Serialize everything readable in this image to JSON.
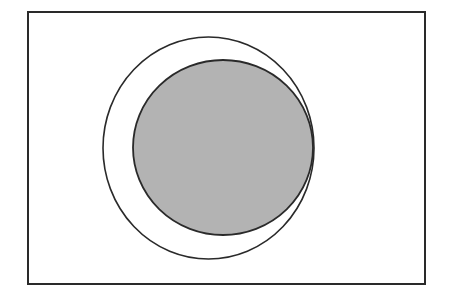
{
  "diagram": {
    "type": "venn-subset",
    "colors": {
      "background": "#ffffff",
      "stroke": "#2a2a2a",
      "shaded_fill": "#b3b3b3"
    },
    "universe": {
      "x": 28,
      "y": 12,
      "width": 397,
      "height": 272
    },
    "outer_set": {
      "cx": 208.5,
      "cy": 148,
      "rx": 105.5,
      "ry": 111,
      "shaded": false
    },
    "inner_set": {
      "cx": 223,
      "cy": 147.5,
      "rx": 90,
      "ry": 87.5,
      "shaded": true
    }
  }
}
